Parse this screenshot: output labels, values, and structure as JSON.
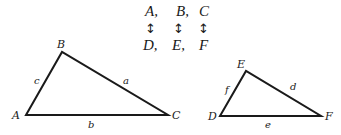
{
  "correspondence": {
    "top_row": [
      "A,",
      "B,",
      "C"
    ],
    "arrows": [
      "↕",
      "↕",
      "↕"
    ],
    "bottom_row": [
      "D,",
      "E,",
      "F"
    ]
  },
  "triangle_abc": {
    "vertices": {
      "A": {
        "label": "A",
        "x": 26,
        "y": 115
      },
      "B": {
        "label": "B",
        "x": 62,
        "y": 52
      },
      "C": {
        "label": "C",
        "x": 168,
        "y": 115
      }
    },
    "sides": {
      "a": {
        "label": "a",
        "between": [
          "B",
          "C"
        ]
      },
      "b": {
        "label": "b",
        "between": [
          "A",
          "C"
        ]
      },
      "c": {
        "label": "c",
        "between": [
          "A",
          "B"
        ]
      }
    }
  },
  "triangle_def": {
    "vertices": {
      "D": {
        "label": "D",
        "x": 220,
        "y": 116
      },
      "E": {
        "label": "E",
        "x": 246,
        "y": 71
      },
      "F": {
        "label": "F",
        "x": 321,
        "y": 116
      }
    },
    "sides": {
      "d": {
        "label": "d",
        "between": [
          "E",
          "F"
        ]
      },
      "e": {
        "label": "e",
        "between": [
          "D",
          "F"
        ]
      },
      "f": {
        "label": "f",
        "between": [
          "D",
          "E"
        ]
      }
    }
  }
}
